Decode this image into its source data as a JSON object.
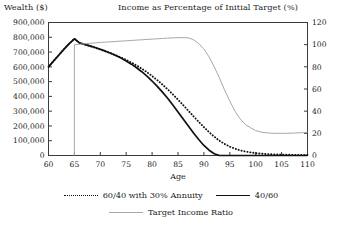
{
  "axis_titles": {
    "left": "Wealth ($)",
    "right": "Income as Percentage of Initial Target (%)"
  },
  "legend": {
    "items": [
      {
        "label": "60/40 with 30% Annuity",
        "style": "dotted",
        "color": "#111111"
      },
      {
        "label": "40/60",
        "style": "solid",
        "color": "#111111"
      },
      {
        "label": "Target Income Ratio",
        "style": "thin-gray",
        "color": "#a8a8a8"
      }
    ]
  },
  "chart_data": {
    "type": "line",
    "title": "",
    "xlabel": "Age",
    "ylabel": "Wealth ($)",
    "y2label": "Income as Percentage of Initial Target (%)",
    "xlim": [
      60,
      110
    ],
    "ylim": [
      0,
      900000
    ],
    "y2lim": [
      0,
      120
    ],
    "grid": false,
    "legend_position": "below",
    "xticks": [
      60,
      65,
      70,
      75,
      80,
      85,
      90,
      95,
      100,
      105,
      110
    ],
    "xtick_labels": [
      "60",
      "65",
      "70",
      "75",
      "80",
      "85",
      "90",
      "95",
      "100",
      "105",
      "110"
    ],
    "yticks": [
      0,
      100000,
      200000,
      300000,
      400000,
      500000,
      600000,
      700000,
      800000,
      900000
    ],
    "ytick_labels": [
      "0",
      "100,000",
      "200,000",
      "300,000",
      "400,000",
      "500,000",
      "600,000",
      "700,000",
      "800,000",
      "900,000"
    ],
    "y2ticks": [
      0,
      20,
      40,
      60,
      80,
      100,
      120
    ],
    "y2tick_labels": [
      "0",
      "20",
      "40",
      "60",
      "80",
      "100",
      "120"
    ],
    "x": [
      60,
      61,
      62,
      63,
      64,
      65,
      66,
      67,
      68,
      69,
      70,
      71,
      72,
      73,
      74,
      75,
      76,
      77,
      78,
      79,
      80,
      81,
      82,
      83,
      84,
      85,
      86,
      87,
      88,
      89,
      90,
      91,
      92,
      93,
      94,
      95,
      96,
      97,
      98,
      99,
      100,
      101,
      102,
      103,
      104,
      105,
      106,
      107,
      108,
      109,
      110
    ],
    "series": [
      {
        "name": "40/60",
        "axis": "left",
        "style": "solid",
        "color": "#111111",
        "values": [
          600000,
          640000,
          680000,
          720000,
          757000,
          790000,
          762000,
          752000,
          742000,
          731000,
          719000,
          706000,
          692000,
          676000,
          659000,
          640000,
          618000,
          594000,
          567000,
          537000,
          504000,
          468000,
          429000,
          387000,
          342000,
          295000,
          247000,
          199000,
          152000,
          108000,
          68000,
          36000,
          12000,
          0,
          0,
          0,
          0,
          0,
          0,
          0,
          0,
          0,
          0,
          0,
          0,
          0,
          0,
          0,
          0,
          0,
          0
        ]
      },
      {
        "name": "60/40 with 30% Annuity",
        "axis": "left",
        "style": "dotted",
        "color": "#111111",
        "values": [
          600000,
          640000,
          680000,
          720000,
          757000,
          790000,
          760000,
          750000,
          740000,
          729000,
          717000,
          705000,
          692000,
          678000,
          663000,
          647000,
          629000,
          609000,
          588000,
          564000,
          538000,
          510000,
          480000,
          448000,
          414000,
          378000,
          341000,
          303000,
          265000,
          228000,
          192000,
          158000,
          127000,
          100000,
          78000,
          60000,
          46000,
          35000,
          27000,
          21000,
          16000,
          13000,
          10000,
          8000,
          7000,
          6000,
          5000,
          4500,
          4000,
          3500,
          3000
        ]
      },
      {
        "name": "Target Income Ratio",
        "axis": "right",
        "style": "thin-gray",
        "color": "#a8a8a8",
        "x_start": 65,
        "values": [
          null,
          null,
          null,
          null,
          null,
          100,
          100.4,
          100.8,
          101.2,
          101.6,
          102,
          102.3,
          102.6,
          102.9,
          103.2,
          103.5,
          103.8,
          104.1,
          104.4,
          104.7,
          105,
          105.3,
          105.6,
          105.9,
          106.1,
          106.3,
          106.3,
          106.2,
          104.5,
          101,
          96,
          89,
          80,
          70,
          59,
          49,
          40,
          33,
          28,
          25,
          22.5,
          21.2,
          20.5,
          20.1,
          20,
          20,
          20,
          20.2,
          20.4,
          20.6,
          20.8
        ]
      }
    ],
    "annotations": [
      {
        "type": "vertical-line",
        "x": 65,
        "color": "#a8a8a8",
        "note": "retirement start at age 65"
      }
    ]
  }
}
